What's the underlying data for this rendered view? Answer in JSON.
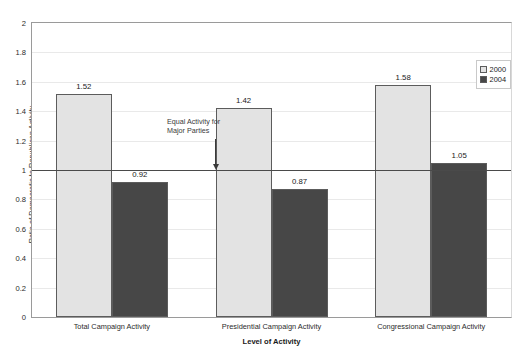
{
  "chart_data": {
    "type": "bar",
    "title": "",
    "xlabel": "Level of Activity",
    "ylabel": "Ratio of Democratic to Republican Activity",
    "categories": [
      "Total Campaign Activity",
      "Presidential Campaign Activity",
      "Congressional Campaign Activity"
    ],
    "series": [
      {
        "name": "2000",
        "values": [
          1.52,
          1.42,
          1.58
        ],
        "color": "#e3e3e3"
      },
      {
        "name": "2004",
        "values": [
          0.92,
          0.87,
          1.05
        ],
        "color": "#474747"
      }
    ],
    "ylim": [
      0,
      2
    ],
    "yticks": [
      0,
      0.2,
      0.4,
      0.6,
      0.8,
      1,
      1.2,
      1.4,
      1.6,
      1.8,
      2
    ],
    "ytick_labels": [
      "0",
      "0.2",
      "0.4",
      "0.6",
      "0.8",
      "1",
      "1.2",
      "1.4",
      "1.6",
      "1.8",
      "2"
    ],
    "grid": true,
    "legend_position": "top-right",
    "reference_line": {
      "value": 1,
      "label_line_1": "Equal Activity for",
      "label_line_2": "Major Parties"
    },
    "data_labels": [
      "1.52",
      "0.92",
      "1.42",
      "0.87",
      "1.58",
      "1.05"
    ]
  },
  "legend": {
    "items": [
      {
        "label": "2000"
      },
      {
        "label": "2004"
      }
    ]
  }
}
